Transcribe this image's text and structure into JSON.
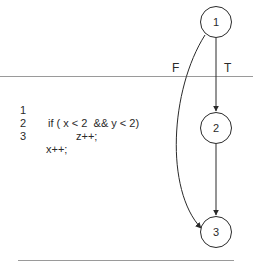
{
  "code": {
    "lines": [
      {
        "number": "1",
        "text": "if ( x < 2  && y < 2)"
      },
      {
        "number": "2",
        "text": "z++;"
      },
      {
        "number": "3",
        "text": "x++;"
      }
    ]
  },
  "graph": {
    "nodes": [
      {
        "id": "1",
        "label": "1"
      },
      {
        "id": "2",
        "label": "2"
      },
      {
        "id": "3",
        "label": "3"
      }
    ],
    "edges": [
      {
        "from": "1",
        "to": "2",
        "label": "T"
      },
      {
        "from": "1",
        "to": "3",
        "label": "F"
      },
      {
        "from": "2",
        "to": "3",
        "label": ""
      }
    ]
  }
}
